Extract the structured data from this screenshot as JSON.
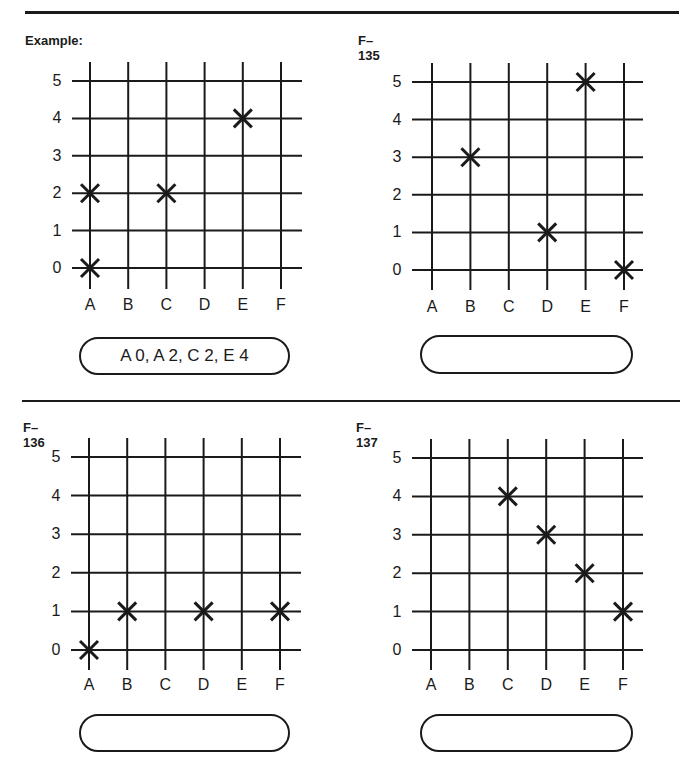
{
  "page": {
    "background": "#ffffff",
    "ink": "#1a1a1a"
  },
  "grid": {
    "columns": [
      "A",
      "B",
      "C",
      "D",
      "E",
      "F"
    ],
    "rows": [
      "5",
      "4",
      "3",
      "2",
      "1",
      "0"
    ]
  },
  "panels": [
    {
      "id": "example",
      "title": "Example:",
      "marks": [
        [
          "A",
          0
        ],
        [
          "A",
          2
        ],
        [
          "C",
          2
        ],
        [
          "E",
          4
        ]
      ],
      "answer": "A 0, A 2, C 2, E 4"
    },
    {
      "id": "f135",
      "title": "F–135",
      "marks": [
        [
          "B",
          3
        ],
        [
          "D",
          1
        ],
        [
          "E",
          5
        ],
        [
          "F",
          0
        ]
      ],
      "answer": ""
    },
    {
      "id": "f136",
      "title": "F–136",
      "marks": [
        [
          "A",
          0
        ],
        [
          "B",
          1
        ],
        [
          "D",
          1
        ],
        [
          "F",
          1
        ]
      ],
      "answer": ""
    },
    {
      "id": "f137",
      "title": "F–137",
      "marks": [
        [
          "C",
          4
        ],
        [
          "D",
          3
        ],
        [
          "E",
          2
        ],
        [
          "F",
          1
        ]
      ],
      "answer": ""
    }
  ],
  "chart_data": [
    {
      "type": "scatter",
      "title": "Example:",
      "categories": [
        "A",
        "B",
        "C",
        "D",
        "E",
        "F"
      ],
      "y_ticks": [
        0,
        1,
        2,
        3,
        4,
        5
      ],
      "points": [
        {
          "x": "A",
          "y": 0
        },
        {
          "x": "A",
          "y": 2
        },
        {
          "x": "C",
          "y": 2
        },
        {
          "x": "E",
          "y": 4
        }
      ],
      "annotation": "A 0, A 2, C 2, E 4",
      "grid": true
    },
    {
      "type": "scatter",
      "title": "F–135",
      "categories": [
        "A",
        "B",
        "C",
        "D",
        "E",
        "F"
      ],
      "y_ticks": [
        0,
        1,
        2,
        3,
        4,
        5
      ],
      "points": [
        {
          "x": "B",
          "y": 3
        },
        {
          "x": "D",
          "y": 1
        },
        {
          "x": "E",
          "y": 5
        },
        {
          "x": "F",
          "y": 0
        }
      ],
      "annotation": "",
      "grid": true
    },
    {
      "type": "scatter",
      "title": "F–136",
      "categories": [
        "A",
        "B",
        "C",
        "D",
        "E",
        "F"
      ],
      "y_ticks": [
        0,
        1,
        2,
        3,
        4,
        5
      ],
      "points": [
        {
          "x": "A",
          "y": 0
        },
        {
          "x": "B",
          "y": 1
        },
        {
          "x": "D",
          "y": 1
        },
        {
          "x": "F",
          "y": 1
        }
      ],
      "annotation": "",
      "grid": true
    },
    {
      "type": "scatter",
      "title": "F–137",
      "categories": [
        "A",
        "B",
        "C",
        "D",
        "E",
        "F"
      ],
      "y_ticks": [
        0,
        1,
        2,
        3,
        4,
        5
      ],
      "points": [
        {
          "x": "C",
          "y": 4
        },
        {
          "x": "D",
          "y": 3
        },
        {
          "x": "E",
          "y": 2
        },
        {
          "x": "F",
          "y": 1
        }
      ],
      "annotation": "",
      "grid": true
    }
  ]
}
